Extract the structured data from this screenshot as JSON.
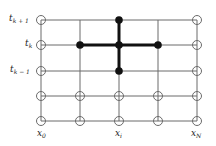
{
  "diagram": {
    "type": "finite-difference grid stencil",
    "columns_x": [
      41,
      80,
      119,
      158,
      197
    ],
    "rows_y": [
      20,
      45,
      71,
      96,
      121
    ],
    "line_color": "#6b6b6b",
    "stencil_color": "#111111",
    "row_labels": [
      {
        "base": "t",
        "sub": "k + 1",
        "row": 0
      },
      {
        "base": "t",
        "sub": "k",
        "row": 1
      },
      {
        "base": "t",
        "sub": "k − 1",
        "row": 2
      }
    ],
    "column_labels": [
      {
        "base": "x",
        "sub": "0",
        "col": 0
      },
      {
        "base": "x",
        "sub": "i",
        "col": 2
      },
      {
        "base": "x",
        "sub": "N",
        "col": 4
      }
    ],
    "boundary_nodes_open_circles": [
      [
        0,
        0
      ],
      [
        0,
        1
      ],
      [
        0,
        2
      ],
      [
        0,
        3
      ],
      [
        0,
        4
      ],
      [
        4,
        0
      ],
      [
        4,
        1
      ],
      [
        4,
        2
      ],
      [
        4,
        3
      ],
      [
        4,
        4
      ],
      [
        1,
        3
      ],
      [
        2,
        3
      ],
      [
        3,
        3
      ],
      [
        1,
        4
      ],
      [
        2,
        4
      ],
      [
        3,
        4
      ]
    ],
    "stencil_nodes_filled": [
      [
        2,
        0
      ],
      [
        1,
        1
      ],
      [
        2,
        1
      ],
      [
        3,
        1
      ],
      [
        2,
        2
      ]
    ],
    "stencil_edges": [
      [
        [
          2,
          0
        ],
        [
          2,
          2
        ]
      ],
      [
        [
          1,
          1
        ],
        [
          3,
          1
        ]
      ]
    ]
  }
}
